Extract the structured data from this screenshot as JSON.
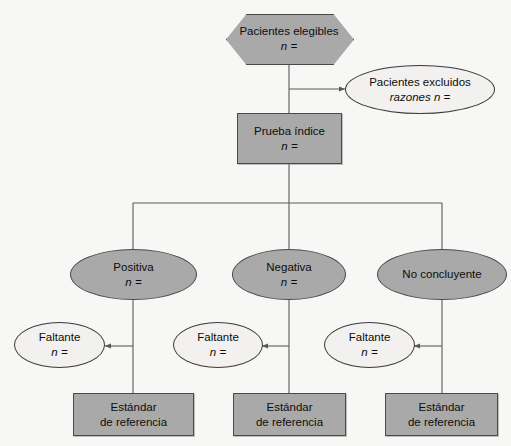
{
  "diagram": {
    "colors": {
      "background": "#f7f7f5",
      "node_fill_gray": "#a9a9a9",
      "node_fill_light": "#f2f1ef",
      "node_border": "#4a4a4a",
      "connector": "#5a5a5a",
      "text": "#0d0d0d"
    },
    "nodes": {
      "eligible": {
        "shape": "hexagon",
        "label": "Pacientes elegibles",
        "value": "n ="
      },
      "excluded": {
        "shape": "ellipse",
        "label": "Pacientes excluidos",
        "value": "razones n ="
      },
      "index_test": {
        "shape": "rectangle",
        "label": "Prueba índice",
        "value": "n ="
      },
      "positive": {
        "shape": "ellipse",
        "label": "Positiva",
        "value": "n ="
      },
      "negative": {
        "shape": "ellipse",
        "label": "Negativa",
        "value": "n ="
      },
      "inconclusive": {
        "shape": "ellipse",
        "label": "No concluyente",
        "value": ""
      },
      "missing_positive": {
        "shape": "ellipse",
        "label": "Faltante",
        "value": "n ="
      },
      "missing_negative": {
        "shape": "ellipse",
        "label": "Faltante",
        "value": "n ="
      },
      "missing_inconclusive": {
        "shape": "ellipse",
        "label": "Faltante",
        "value": "n ="
      },
      "reference_positive": {
        "shape": "rectangle",
        "label_line1": "Estándar",
        "label_line2": "de referencia"
      },
      "reference_negative": {
        "shape": "rectangle",
        "label_line1": "Estándar",
        "label_line2": "de referencia"
      },
      "reference_inconclusive": {
        "shape": "rectangle",
        "label_line1": "Estándar",
        "label_line2": "de referencia"
      }
    },
    "edges": [
      {
        "from": "eligible",
        "to": "index_test",
        "arrow": false
      },
      {
        "from": "eligible",
        "to": "excluded",
        "arrow": true
      },
      {
        "from": "index_test",
        "to": "positive",
        "arrow": false
      },
      {
        "from": "index_test",
        "to": "negative",
        "arrow": false
      },
      {
        "from": "index_test",
        "to": "inconclusive",
        "arrow": false
      },
      {
        "from": "positive",
        "to": "missing_positive",
        "arrow": true
      },
      {
        "from": "positive",
        "to": "reference_positive",
        "arrow": false
      },
      {
        "from": "negative",
        "to": "missing_negative",
        "arrow": true
      },
      {
        "from": "negative",
        "to": "reference_negative",
        "arrow": false
      },
      {
        "from": "inconclusive",
        "to": "missing_inconclusive",
        "arrow": true
      },
      {
        "from": "inconclusive",
        "to": "reference_inconclusive",
        "arrow": false
      }
    ]
  }
}
